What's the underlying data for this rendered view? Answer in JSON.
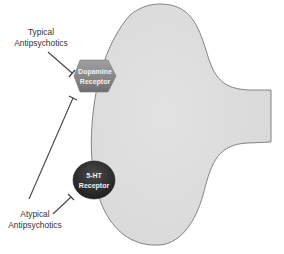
{
  "diagram": {
    "type": "neuron-receptor-inhibition",
    "cell": {
      "name": "neuron",
      "fill": "#dedede",
      "stroke": "#777777"
    },
    "receptors": [
      {
        "id": "dopamine",
        "line1": "Dopamine",
        "line2": "Receptor",
        "shape": "hexagon",
        "fill": "#8a8a8a"
      },
      {
        "id": "serotonin",
        "line1": "5-HT",
        "line2": "Receptor",
        "shape": "ellipse",
        "fill": "#2e2e2e"
      }
    ],
    "drugs": [
      {
        "id": "typical",
        "line1": "Typical",
        "line2": "Antipsychotics",
        "inhibits": [
          "dopamine"
        ]
      },
      {
        "id": "atypical",
        "line1": "Atypical",
        "line2": "Antipsychotics",
        "inhibits": [
          "dopamine",
          "serotonin"
        ]
      }
    ],
    "colors": {
      "line": "#444444",
      "text": "#333333"
    }
  }
}
